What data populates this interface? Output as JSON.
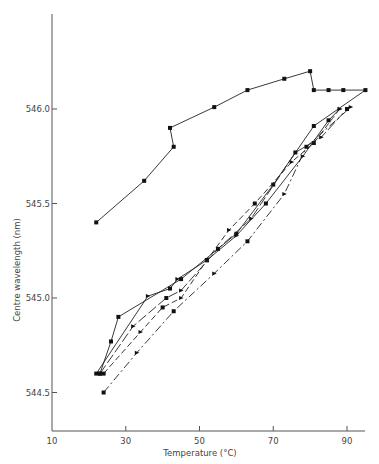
{
  "chart_data": {
    "type": "line",
    "title": "",
    "xlabel": "Temperature (°C)",
    "ylabel": "Centre wavelength (nm)",
    "xlim": [
      10,
      95
    ],
    "ylim": [
      544.3,
      546.5
    ],
    "x_ticks": [
      "10",
      "30",
      "50",
      "70",
      "90"
    ],
    "y_ticks": [
      "544.5",
      "545.0",
      "545.5",
      "546.0"
    ],
    "grid": false,
    "legend": "none",
    "series": [
      {
        "name": "run-1 (solid, upper hysteresis loop)",
        "style": "solid",
        "x": [
          22,
          35,
          43,
          42,
          54,
          63,
          73,
          80,
          81,
          85,
          89,
          95,
          81,
          70,
          60,
          45,
          28,
          26,
          23
        ],
        "y": [
          545.4,
          545.62,
          545.8,
          545.9,
          546.01,
          546.1,
          546.16,
          546.2,
          546.1,
          546.1,
          546.1,
          546.1,
          545.91,
          545.6,
          545.34,
          545.1,
          544.9,
          544.77,
          544.6
        ]
      },
      {
        "name": "run-2 (solid)",
        "style": "solid",
        "x": [
          22,
          36,
          42,
          44,
          52,
          60,
          68,
          78,
          85,
          88
        ],
        "y": [
          544.6,
          545.01,
          545.05,
          545.1,
          545.2,
          545.33,
          545.5,
          545.75,
          545.94,
          546.0
        ]
      },
      {
        "name": "run-3 (dash)",
        "style": "dash",
        "x": [
          24,
          34,
          40,
          45,
          52,
          58,
          65,
          75,
          81,
          88
        ],
        "y": [
          544.6,
          544.82,
          544.95,
          545.0,
          545.2,
          545.36,
          545.5,
          545.72,
          545.82,
          546.0
        ]
      },
      {
        "name": "run-4 (dash-dot)",
        "style": "dashdot",
        "x": [
          24,
          33,
          43,
          54,
          63,
          73,
          79,
          91
        ],
        "y": [
          544.5,
          544.71,
          544.93,
          545.13,
          545.3,
          545.55,
          545.8,
          546.01
        ]
      },
      {
        "name": "run-5 (long dash)",
        "style": "longdash",
        "x": [
          23,
          32,
          41,
          45,
          55,
          64,
          76,
          83,
          90
        ],
        "y": [
          544.6,
          544.85,
          545.0,
          545.04,
          545.26,
          545.42,
          545.77,
          545.85,
          546.0
        ]
      }
    ]
  }
}
